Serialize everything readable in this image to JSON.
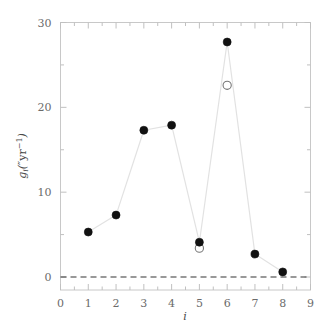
{
  "chart_data": {
    "type": "scatter",
    "title": "",
    "xlabel": "i",
    "ylabel": "g_i(\"yr^-1)",
    "ylabel_parts": {
      "symbol": "g",
      "subscript": "i",
      "open_paren": "(",
      "unit_prefix": "″",
      "unit": "yr",
      "exponent": "−1",
      "close_paren": ")"
    },
    "xlim": [
      0,
      9
    ],
    "ylim": [
      0,
      30
    ],
    "xticks": [
      "0",
      "1",
      "2",
      "3",
      "4",
      "5",
      "6",
      "7",
      "8",
      "9"
    ],
    "yticks": [
      "0",
      "10",
      "20",
      "30"
    ],
    "y_minor_ticks": [
      5,
      15,
      25
    ],
    "grid": false,
    "legend": null,
    "x": [
      1,
      2,
      3,
      4,
      5,
      6,
      7,
      8
    ],
    "series": [
      {
        "name": "filled",
        "marker": "filled-circle",
        "color": "#111111",
        "connected": true,
        "line_color": "#e2e2e2",
        "points": [
          {
            "x": 1,
            "y": 5.3
          },
          {
            "x": 2,
            "y": 7.3
          },
          {
            "x": 3,
            "y": 17.3
          },
          {
            "x": 4,
            "y": 17.9
          },
          {
            "x": 5,
            "y": 4.1
          },
          {
            "x": 6,
            "y": 27.7
          },
          {
            "x": 7,
            "y": 2.7
          },
          {
            "x": 8,
            "y": 0.6
          }
        ]
      },
      {
        "name": "open",
        "marker": "open-circle",
        "color": "#777777",
        "connected": false,
        "points": [
          {
            "x": 5,
            "y": 3.4
          },
          {
            "x": 6,
            "y": 22.6
          }
        ]
      }
    ],
    "reference_lines": [
      {
        "name": "zero-line",
        "orientation": "horizontal",
        "value": 0,
        "style": "dashed",
        "color": "#333333"
      }
    ]
  },
  "axes": {
    "frame_color": "#c8c8c8",
    "tick_color": "#c0c0c0"
  }
}
